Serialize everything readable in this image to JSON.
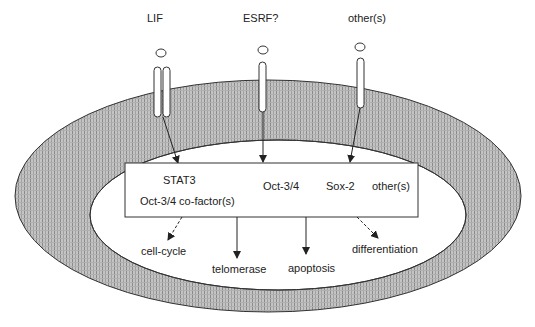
{
  "diagram": {
    "ligands": [
      {
        "label": "LIF",
        "x": 161
      },
      {
        "label": "ESRF?",
        "x": 262
      },
      {
        "label": "other(s)",
        "x": 360
      }
    ],
    "nucleus_box": {
      "factors": {
        "stat3": "STAT3",
        "cofactor": "Oct-3/4 co-factor(s)",
        "oct": "Oct-3/4",
        "sox": "Sox-2",
        "other": "other(s)"
      }
    },
    "outcomes": [
      {
        "label": "cell-cycle"
      },
      {
        "label": "telomerase"
      },
      {
        "label": "apoptosis"
      },
      {
        "label": "differentiation"
      }
    ],
    "colors": {
      "membrane_fill": "#bdbdbd",
      "membrane_stripe": "#8e8e8e",
      "line": "#222222",
      "background": "#ffffff"
    }
  }
}
